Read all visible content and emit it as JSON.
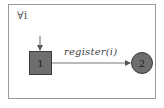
{
  "diagram": {
    "quantifier": "∀i",
    "states": [
      {
        "id": "1",
        "label": "1",
        "shape": "square",
        "initial": true
      },
      {
        "id": "2",
        "label": "2",
        "shape": "circle"
      }
    ],
    "transitions": [
      {
        "from": "1",
        "to": "2",
        "label": "register(i)"
      }
    ],
    "colors": {
      "node_fill": "#6e6e6e",
      "stroke": "#3a3a3a",
      "frame": "#9a9a9a"
    }
  }
}
